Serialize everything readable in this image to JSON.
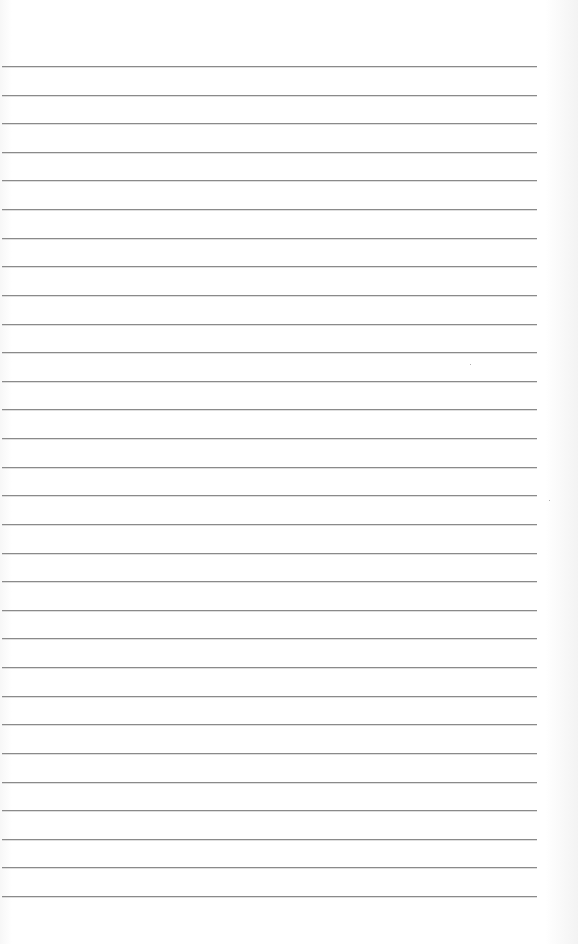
{
  "page": {
    "type": "lined-paper",
    "background_color": "#fdfdfd",
    "rule_color": "#8a8a8a",
    "rule_count": 30,
    "text": ""
  }
}
